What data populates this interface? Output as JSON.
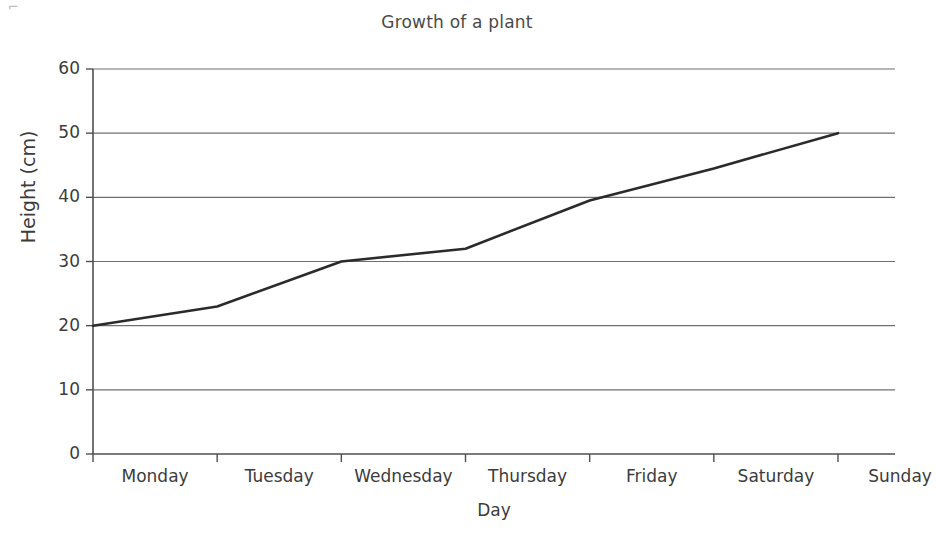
{
  "scan": {
    "artifact_mark": "⌐"
  },
  "chart_data": {
    "type": "line",
    "title": "Growth of a plant",
    "xlabel": "Day",
    "ylabel": "Height (cm)",
    "categories": [
      "Monday",
      "Tuesday",
      "Wednesday",
      "Thursday",
      "Friday",
      "Saturday",
      "Sunday"
    ],
    "values": [
      20,
      23,
      30,
      32,
      39.5,
      44.5,
      50
    ],
    "series": [
      {
        "name": "Height",
        "values": [
          20,
          23,
          30,
          32,
          39.5,
          44.5,
          50
        ]
      }
    ],
    "ylim": [
      0,
      60
    ],
    "y_ticks": [
      0,
      10,
      20,
      30,
      40,
      50,
      60
    ],
    "y_tick_labels": [
      "0",
      "10",
      "20",
      "30",
      "40",
      "50",
      "60"
    ],
    "x_tick_labels": [
      "Monday",
      "Tuesday",
      "Wednesday",
      "Thursday",
      "Friday",
      "Saturday",
      "Sunday"
    ],
    "grid": "horizontal",
    "legend": "none",
    "line_color": "#2b2b2b",
    "grid_color": "#6f6f6f",
    "axis_color": "#4f4f4f",
    "background_color": "#ffffff",
    "annotations": []
  }
}
